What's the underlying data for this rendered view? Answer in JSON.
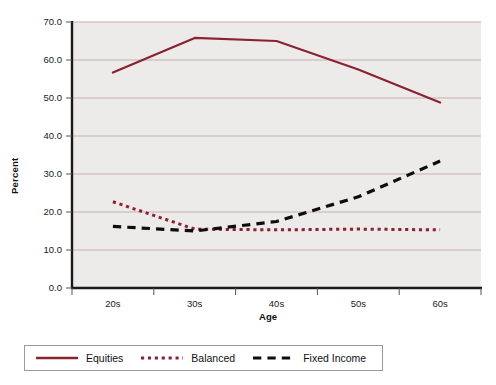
{
  "chart_data": {
    "type": "line",
    "title": "",
    "xlabel": "Age",
    "ylabel": "Percent",
    "categories": [
      "20s",
      "30s",
      "40s",
      "50s",
      "60s"
    ],
    "ylim": [
      0.0,
      70.0
    ],
    "yticks": [
      "0.0",
      "10.0",
      "20.0",
      "30.0",
      "40.0",
      "50.0",
      "60.0",
      "70.0"
    ],
    "ytick_values": [
      0.0,
      10.0,
      20.0,
      30.0,
      40.0,
      50.0,
      60.0,
      70.0
    ],
    "grid": true,
    "legend_position": "bottom",
    "series": [
      {
        "name": "Equities",
        "values": [
          56.7,
          65.8,
          65.0,
          57.5,
          48.8
        ],
        "color": "#8a2230",
        "style": "solid"
      },
      {
        "name": "Balanced",
        "values": [
          22.7,
          15.5,
          15.3,
          15.5,
          15.3
        ],
        "color": "#8a2230",
        "style": "dotted"
      },
      {
        "name": "Fixed Income",
        "values": [
          16.2,
          15.0,
          17.5,
          24.0,
          33.4
        ],
        "color": "#0d0d0d",
        "style": "dashed"
      }
    ]
  },
  "plot": {
    "background": "#edeaea",
    "gridline_color": "#c9aeb2",
    "axis_color": "#1a1a1a"
  },
  "legend": {
    "entries": [
      {
        "label": "Equities"
      },
      {
        "label": "Balanced"
      },
      {
        "label": "Fixed Income"
      }
    ]
  }
}
